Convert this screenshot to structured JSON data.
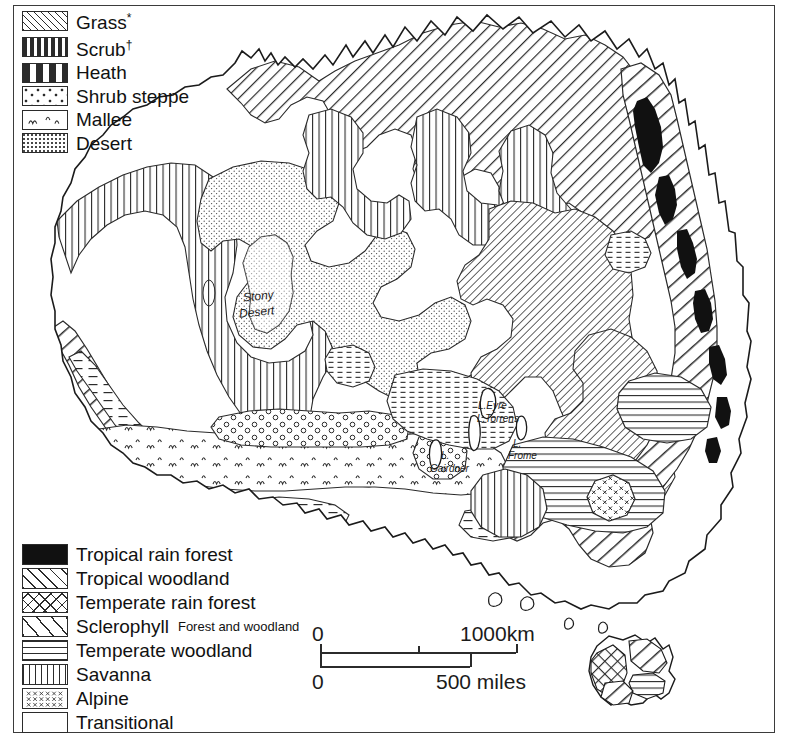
{
  "map": {
    "title_region": "Australia",
    "place_labels": [
      {
        "name": "stony-desert",
        "text": "Stony",
        "x": 243,
        "y": 289,
        "size": 12,
        "italic": true,
        "rotate": -6
      },
      {
        "name": "stony-desert-2",
        "text": "Desert",
        "x": 239,
        "y": 305,
        "size": 12,
        "italic": true,
        "rotate": -6
      },
      {
        "name": "lake-eyre",
        "text": "L.Eyre",
        "x": 478,
        "y": 400,
        "size": 10,
        "italic": true,
        "rotate": 0
      },
      {
        "name": "lake-torrens",
        "text": "L.Torrens",
        "x": 477,
        "y": 413,
        "size": 10,
        "italic": true,
        "rotate": 0
      },
      {
        "name": "lake-frome",
        "text": "L.",
        "x": 513,
        "y": 438,
        "size": 10,
        "italic": true,
        "rotate": 0
      },
      {
        "name": "lake-frome-2",
        "text": "Frome",
        "x": 508,
        "y": 450,
        "size": 10,
        "italic": true,
        "rotate": 0
      },
      {
        "name": "lake-gairdner",
        "text": "L.",
        "x": 441,
        "y": 450,
        "size": 10,
        "italic": true,
        "rotate": 0
      },
      {
        "name": "lake-gairdner-2",
        "text": "Gairdner",
        "x": 430,
        "y": 463,
        "size": 10,
        "italic": true,
        "rotate": 0
      }
    ]
  },
  "legend_top": {
    "title": "",
    "items": [
      {
        "label": "Grass",
        "sup": "*",
        "pattern": "p-grass",
        "name": "grass"
      },
      {
        "label": "Scrub",
        "sup": "†",
        "pattern": "p-scrub",
        "name": "scrub"
      },
      {
        "label": "Heath",
        "sup": "",
        "pattern": "p-heath",
        "name": "heath"
      },
      {
        "label": "Shrub steppe",
        "sup": "",
        "pattern": "p-shrubsteppe",
        "name": "shrub-steppe"
      },
      {
        "label": "Mallee",
        "sup": "",
        "pattern": "p-mallee",
        "name": "mallee"
      },
      {
        "label": "Desert",
        "sup": "",
        "pattern": "p-desert",
        "name": "desert"
      }
    ]
  },
  "legend_bottom": {
    "items": [
      {
        "label": "Tropical rain forest",
        "sub": "",
        "pattern": "p-black",
        "name": "tropical-rain-forest"
      },
      {
        "label": "Tropical woodland",
        "sub": "",
        "pattern": "p-tropwood",
        "name": "tropical-woodland"
      },
      {
        "label": "Temperate rain forest",
        "sub": "",
        "pattern": "p-temprain",
        "name": "temperate-rain-forest"
      },
      {
        "label": "Sclerophyll",
        "sub": "Forest and woodland",
        "pattern": "p-scler",
        "name": "sclerophyll"
      },
      {
        "label": "Temperate woodland",
        "sub": "",
        "pattern": "p-tempwood",
        "name": "temperate-woodland"
      },
      {
        "label": "Savanna",
        "sub": "",
        "pattern": "p-savanna",
        "name": "savanna"
      },
      {
        "label": "Alpine",
        "sub": "",
        "pattern": "p-alpine",
        "name": "alpine"
      },
      {
        "label": "Transitional",
        "sub": "",
        "pattern": "p-transitional",
        "name": "transitional"
      }
    ]
  },
  "scale_bar": {
    "km": {
      "start_label": "0",
      "end_label": "1000km",
      "length_px": 196,
      "mid_tick_frac": 0.5
    },
    "miles": {
      "start_label": "0",
      "end_label": "500 miles",
      "length_px": 150
    }
  },
  "colors": {
    "ink": "#2b2b2b",
    "frame": "#3b3b3b",
    "paper": "#ffffff",
    "rainforest": "#111111"
  }
}
